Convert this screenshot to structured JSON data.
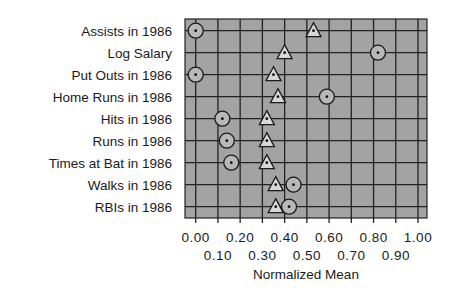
{
  "chart_data": {
    "type": "scatter",
    "title": "",
    "xlabel": "Normalized Mean",
    "ylabel": "",
    "xlim": [
      0.0,
      1.0
    ],
    "grid": true,
    "legend": null,
    "categories": [
      "Assists in 1986",
      "Log Salary",
      "Put Outs in 1986",
      "Home Runs in 1986",
      "Hits in 1986",
      "Runs in 1986",
      "Times at Bat in 1986",
      "Walks in 1986",
      "RBIs in 1986"
    ],
    "x_ticks_row1": [
      "0.00",
      "0.20",
      "0.40",
      "0.60",
      "0.80",
      "1.00"
    ],
    "x_ticks_row2": [
      "0.10",
      "0.30",
      "0.50",
      "0.70",
      "0.90"
    ],
    "series": [
      {
        "name": "circle",
        "marker": "circle",
        "values": [
          0.0,
          0.82,
          0.0,
          0.59,
          0.12,
          0.14,
          0.16,
          0.44,
          0.42
        ]
      },
      {
        "name": "triangle",
        "marker": "triangle",
        "values": [
          0.53,
          0.4,
          0.35,
          0.37,
          0.32,
          0.32,
          0.32,
          0.36,
          0.36
        ]
      }
    ]
  },
  "colors": {
    "plot_background": "#a3a3a3",
    "grid": "#222222",
    "marker_fill": "#b8b8b8",
    "triangle_fill": "#d8d8d8",
    "marker_stroke": "#1a1a1a"
  }
}
